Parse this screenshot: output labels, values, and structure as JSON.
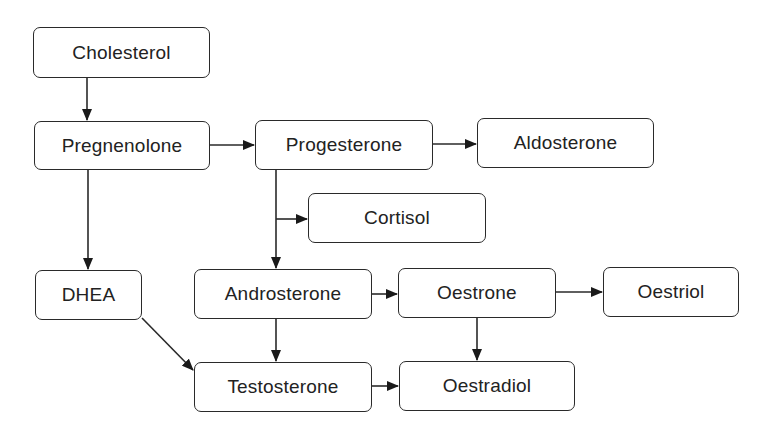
{
  "diagram": {
    "type": "flowchart",
    "nodes": [
      {
        "id": "cholesterol",
        "label": "Cholesterol",
        "x": 33,
        "y": 27,
        "w": 177,
        "h": 51
      },
      {
        "id": "pregnenolone",
        "label": "Pregnenolone",
        "x": 34,
        "y": 121,
        "w": 176,
        "h": 49
      },
      {
        "id": "progesterone",
        "label": "Progesterone",
        "x": 255,
        "y": 120,
        "w": 178,
        "h": 50
      },
      {
        "id": "aldosterone",
        "label": "Aldosterone",
        "x": 477,
        "y": 118,
        "w": 177,
        "h": 50
      },
      {
        "id": "cortisol",
        "label": "Cortisol",
        "x": 308,
        "y": 193,
        "w": 178,
        "h": 50
      },
      {
        "id": "dhea",
        "label": "DHEA",
        "x": 35,
        "y": 270,
        "w": 107,
        "h": 50
      },
      {
        "id": "androsterone",
        "label": "Androsterone",
        "x": 194,
        "y": 269,
        "w": 178,
        "h": 50
      },
      {
        "id": "oestrone",
        "label": "Oestrone",
        "x": 398,
        "y": 268,
        "w": 158,
        "h": 50
      },
      {
        "id": "oestriol",
        "label": "Oestriol",
        "x": 603,
        "y": 267,
        "w": 136,
        "h": 50
      },
      {
        "id": "testosterone",
        "label": "Testosterone",
        "x": 194,
        "y": 362,
        "w": 178,
        "h": 50
      },
      {
        "id": "oestradiol",
        "label": "Oestradiol",
        "x": 399,
        "y": 361,
        "w": 176,
        "h": 50
      }
    ],
    "edges": [
      {
        "from": "cholesterol",
        "to": "pregnenolone"
      },
      {
        "from": "pregnenolone",
        "to": "progesterone"
      },
      {
        "from": "pregnenolone",
        "to": "dhea"
      },
      {
        "from": "progesterone",
        "to": "aldosterone"
      },
      {
        "from": "progesterone",
        "to": "cortisol"
      },
      {
        "from": "progesterone",
        "to": "androsterone"
      },
      {
        "from": "dhea",
        "to": "testosterone"
      },
      {
        "from": "androsterone",
        "to": "oestrone"
      },
      {
        "from": "androsterone",
        "to": "testosterone"
      },
      {
        "from": "oestrone",
        "to": "oestriol"
      },
      {
        "from": "oestrone",
        "to": "oestradiol"
      },
      {
        "from": "testosterone",
        "to": "oestradiol"
      }
    ],
    "colors": {
      "stroke": "#2a2a2a",
      "text": "#222222",
      "background": "#ffffff"
    }
  }
}
